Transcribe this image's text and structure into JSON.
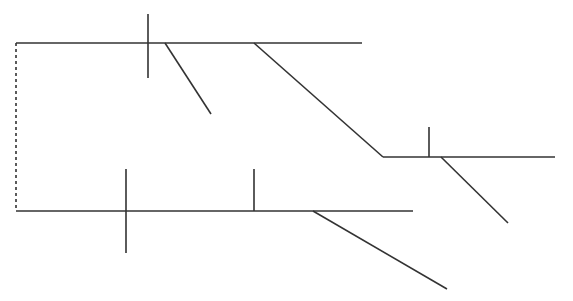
{
  "diagram": {
    "type": "track-schematic",
    "stroke_color": "#333333",
    "background": "#ffffff",
    "segments": [
      {
        "id": "top-main-line",
        "x1": 16,
        "y1": 43,
        "x2": 362,
        "y2": 43,
        "style": "solid"
      },
      {
        "id": "top-signal-tick",
        "x1": 148,
        "y1": 14,
        "x2": 148,
        "y2": 78,
        "style": "solid"
      },
      {
        "id": "top-short-branch",
        "x1": 165,
        "y1": 43,
        "x2": 211,
        "y2": 114,
        "style": "solid"
      },
      {
        "id": "top-to-middle-connector",
        "x1": 254,
        "y1": 43,
        "x2": 383,
        "y2": 157,
        "style": "solid"
      },
      {
        "id": "middle-line",
        "x1": 383,
        "y1": 157,
        "x2": 555,
        "y2": 157,
        "style": "solid"
      },
      {
        "id": "middle-signal-tick",
        "x1": 429,
        "y1": 127,
        "x2": 429,
        "y2": 157,
        "style": "solid"
      },
      {
        "id": "middle-branch",
        "x1": 441,
        "y1": 157,
        "x2": 508,
        "y2": 223,
        "style": "solid"
      },
      {
        "id": "bottom-main-line",
        "x1": 16,
        "y1": 211,
        "x2": 413,
        "y2": 211,
        "style": "solid"
      },
      {
        "id": "bottom-cross-tick",
        "x1": 126,
        "y1": 169,
        "x2": 126,
        "y2": 253,
        "style": "solid"
      },
      {
        "id": "bottom-signal-tick",
        "x1": 254,
        "y1": 169,
        "x2": 254,
        "y2": 211,
        "style": "solid"
      },
      {
        "id": "bottom-branch",
        "x1": 313,
        "y1": 211,
        "x2": 447,
        "y2": 289,
        "style": "solid"
      },
      {
        "id": "left-dashed-link",
        "x1": 16,
        "y1": 43,
        "x2": 16,
        "y2": 211,
        "style": "dashed"
      }
    ]
  }
}
